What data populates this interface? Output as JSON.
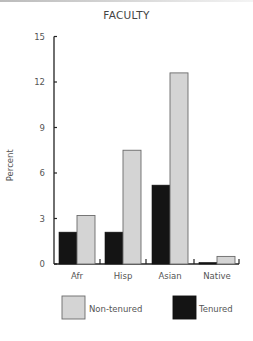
{
  "chart_data": {
    "type": "bar",
    "title": "FACULTY",
    "xlabel": "",
    "ylabel": "Percent",
    "ylim": [
      0,
      15
    ],
    "yticks": [
      0,
      3,
      6,
      9,
      12,
      15
    ],
    "grid": false,
    "legend_position": "bottom",
    "categories": [
      "Afr",
      "Hisp",
      "Asian",
      "Native"
    ],
    "series": [
      {
        "name": "Tenured",
        "color": "#141414",
        "values": [
          2.1,
          2.1,
          5.2,
          0.1
        ]
      },
      {
        "name": "Non-tenured",
        "color": "#d4d4d4",
        "values": [
          3.2,
          7.5,
          12.6,
          0.5
        ]
      }
    ]
  },
  "legend": {
    "items": [
      {
        "label": "Non-tenured",
        "color": "#d4d4d4"
      },
      {
        "label": "Tenured",
        "color": "#141414"
      }
    ]
  }
}
